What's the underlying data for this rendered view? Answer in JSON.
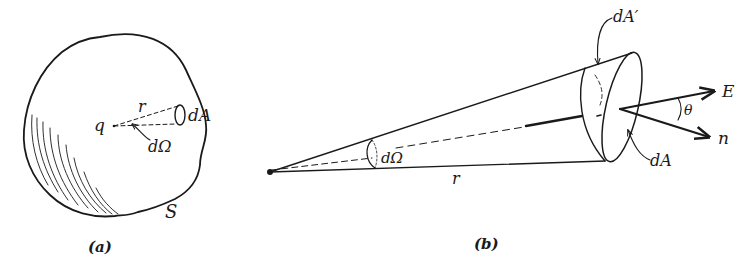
{
  "figure_a": {
    "caption": "(a)",
    "labels": {
      "charge": "q",
      "radius": "r",
      "area_element": "dA",
      "solid_angle": "dΩ",
      "surface": "S"
    }
  },
  "figure_b": {
    "caption": "(b)",
    "labels": {
      "projected_area": "dA′",
      "solid_angle": "dΩ",
      "radius": "r",
      "area_element": "dA",
      "field": "E",
      "normal": "n",
      "angle": "θ"
    }
  },
  "colors": {
    "ink": "#1a1a1a",
    "background": "#ffffff"
  }
}
